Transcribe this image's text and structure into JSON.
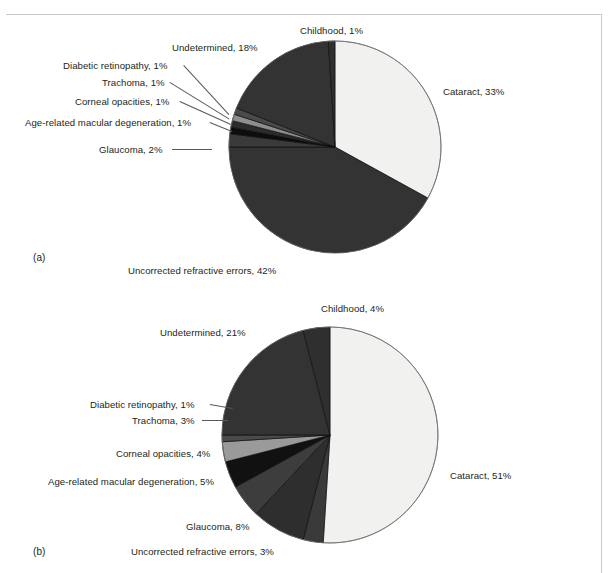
{
  "page": {
    "background": "#ffffff",
    "text_color": "#231f20",
    "rule_color": "#c9c9c9"
  },
  "panels": [
    {
      "tag": "(a)",
      "tag_x": 33,
      "tag_y": 252,
      "center": {
        "x": 335,
        "y": 147
      },
      "radius": 106,
      "chart_data": {
        "type": "pie",
        "title": "",
        "start_angle_deg": 0,
        "direction": "clockwise",
        "units": "%",
        "categories": [
          "Cataract",
          "Uncorrected refractive errors",
          "Glaucoma",
          "Age-related macular degeneration",
          "Corneal opacities",
          "Trachoma",
          "Diabetic retinopathy",
          "Undetermined",
          "Childhood"
        ],
        "values": [
          33,
          42,
          2,
          1,
          1,
          1,
          1,
          18,
          1
        ],
        "colors": [
          "#f1f1ef",
          "#333333",
          "#3a3a3a",
          "#0d0d0d",
          "#2b2b2b",
          "#8e8e8e",
          "#4a4a4a",
          "#333333",
          "#2f2f2f"
        ],
        "labels": [
          "Cataract, 33%",
          "Uncorrected refractive errors, 42%",
          "Glaucoma, 2%",
          "Age-related macular degeneration, 1%",
          "Corneal opacities, 1%",
          "Trachoma, 1%",
          "Diabetic retinopathy, 1%",
          "Undetermined, 18%",
          "Childhood, 1%"
        ]
      },
      "label_positions": [
        {
          "key": "cataract",
          "text": "Cataract, 33%",
          "x": 443,
          "y": 86,
          "align": "left",
          "leader": null
        },
        {
          "key": "uncorrected",
          "text": "Uncorrected refractive errors, 42%",
          "x": 128,
          "y": 265,
          "align": "left",
          "leader": null
        },
        {
          "key": "glaucoma",
          "text": "Glaucoma, 2%",
          "x": 99,
          "y": 144,
          "align": "left",
          "leader": {
            "x1": 172,
            "y1": 149,
            "x2": 212,
            "y2": 149
          }
        },
        {
          "key": "amd",
          "text": "Age-related macular degeneration, 1%",
          "x": 25,
          "y": 117,
          "align": "left",
          "leader": {
            "x1": 210,
            "y1": 122,
            "x2": 232,
            "y2": 131
          }
        },
        {
          "key": "corneal",
          "text": "Corneal opacities, 1%",
          "x": 75,
          "y": 96,
          "align": "left",
          "leader": {
            "x1": 180,
            "y1": 101,
            "x2": 231,
            "y2": 124
          }
        },
        {
          "key": "trachoma",
          "text": "Trachoma, 1%",
          "x": 102,
          "y": 77,
          "align": "left",
          "leader": {
            "x1": 170,
            "y1": 82,
            "x2": 230,
            "y2": 119
          }
        },
        {
          "key": "diabetic",
          "text": "Diabetic retinopathy, 1%",
          "x": 63,
          "y": 60,
          "align": "left",
          "leader": {
            "x1": 184,
            "y1": 65,
            "x2": 229,
            "y2": 114
          }
        },
        {
          "key": "undetermined",
          "text": "Undetermined, 18%",
          "x": 172,
          "y": 42,
          "align": "left",
          "leader": null
        },
        {
          "key": "childhood",
          "text": "Childhood, 1%",
          "x": 300,
          "y": 25,
          "align": "left",
          "leader": null
        }
      ]
    },
    {
      "tag": "(b)",
      "tag_x": 33,
      "tag_y": 546,
      "center": {
        "x": 330,
        "y": 435
      },
      "radius": 108,
      "chart_data": {
        "type": "pie",
        "title": "",
        "start_angle_deg": 0,
        "direction": "clockwise",
        "units": "%",
        "categories": [
          "Cataract",
          "Uncorrected refractive errors",
          "Glaucoma",
          "Age-related macular degeneration",
          "Corneal opacities",
          "Trachoma",
          "Diabetic retinopathy",
          "Undetermined",
          "Childhood"
        ],
        "values": [
          51,
          3,
          8,
          5,
          4,
          3,
          1,
          21,
          4
        ],
        "colors": [
          "#f1f1ef",
          "#3a3a3a",
          "#2e2e2e",
          "#3d3d3d",
          "#111111",
          "#9a9a9a",
          "#4a4a4a",
          "#333333",
          "#2f2f2f"
        ],
        "labels": [
          "Cataract, 51%",
          "Uncorrected refractive errors, 3%",
          "Glaucoma, 8%",
          "Age-related macular degeneration, 5%",
          "Corneal opacities, 4%",
          "Trachoma, 3%",
          "Diabetic retinopathy, 1%",
          "Undetermined, 21%",
          "Childhood, 4%"
        ]
      },
      "label_positions": [
        {
          "key": "cataract",
          "text": "Cataract, 51%",
          "x": 450,
          "y": 470,
          "align": "left",
          "leader": null
        },
        {
          "key": "uncorrected",
          "text": "Uncorrected refractive errors, 3%",
          "x": 131,
          "y": 546,
          "align": "left",
          "leader": null
        },
        {
          "key": "glaucoma",
          "text": "Glaucoma, 8%",
          "x": 186,
          "y": 521,
          "align": "left",
          "leader": null
        },
        {
          "key": "amd",
          "text": "Age-related macular degeneration, 5%",
          "x": 48,
          "y": 476,
          "align": "left",
          "leader": null
        },
        {
          "key": "corneal",
          "text": "Corneal opacities, 4%",
          "x": 116,
          "y": 448,
          "align": "left",
          "leader": null
        },
        {
          "key": "trachoma",
          "text": "Trachoma, 3%",
          "x": 132,
          "y": 415,
          "align": "left",
          "leader": {
            "x1": 202,
            "y1": 420,
            "x2": 228,
            "y2": 420
          }
        },
        {
          "key": "diabetic",
          "text": "Diabetic retinopathy, 1%",
          "x": 90,
          "y": 399,
          "align": "left",
          "leader": {
            "x1": 210,
            "y1": 404,
            "x2": 233,
            "y2": 408
          }
        },
        {
          "key": "undetermined",
          "text": "Undetermined, 21%",
          "x": 160,
          "y": 327,
          "align": "left",
          "leader": null
        },
        {
          "key": "childhood",
          "text": "Childhood, 4%",
          "x": 321,
          "y": 303,
          "align": "left",
          "leader": null
        }
      ]
    }
  ]
}
